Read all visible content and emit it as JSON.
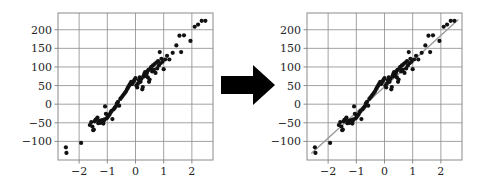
{
  "figure": {
    "title": "",
    "panel_count": 2,
    "arrow": {
      "icon": "right-arrow-icon",
      "direction": "right",
      "color": "#000000"
    }
  },
  "chart_data": [
    {
      "id": "left",
      "type": "scatter",
      "title": "",
      "subtitle": "",
      "xlabel": "",
      "ylabel": "",
      "xlim": [
        -2.75,
        2.75
      ],
      "ylim": [
        -150,
        245
      ],
      "xticks": [
        -2,
        -1,
        0,
        1,
        2
      ],
      "xticklabels": [
        "−2",
        "−1",
        "0",
        "1",
        "2"
      ],
      "yticks": [
        -100,
        -50,
        0,
        50,
        100,
        150,
        200
      ],
      "yticklabels": [
        "−100",
        "−50",
        "0",
        "50",
        "100",
        "150",
        "200"
      ],
      "grid": true,
      "legend": null,
      "annotations": [],
      "marker": {
        "shape": "circle",
        "color": "#111111",
        "size": 2.1
      },
      "fit_line": null,
      "x": [
        -2.47,
        -2.45,
        -1.93,
        -1.62,
        -1.57,
        -1.53,
        -1.5,
        -1.48,
        -1.45,
        -1.42,
        -1.38,
        -1.35,
        -1.32,
        -1.3,
        -1.28,
        -1.26,
        -1.24,
        -1.22,
        -1.2,
        -1.18,
        -1.16,
        -1.14,
        -1.12,
        -1.1,
        -1.08,
        -1.05,
        -1.02,
        -0.98,
        -0.95,
        -0.92,
        -0.88,
        -0.85,
        -0.82,
        -0.78,
        -0.74,
        -0.7,
        -0.66,
        -0.62,
        -0.58,
        -0.54,
        -0.5,
        -0.46,
        -0.42,
        -0.38,
        -0.34,
        -0.3,
        -0.27,
        -0.24,
        -0.21,
        -0.18,
        -0.15,
        -0.12,
        -0.09,
        -0.06,
        -0.03,
        0.0,
        0.03,
        0.06,
        0.09,
        0.12,
        0.15,
        0.18,
        0.21,
        0.24,
        0.26,
        0.28,
        0.3,
        0.32,
        0.34,
        0.36,
        0.38,
        0.4,
        0.42,
        0.44,
        0.46,
        0.48,
        0.5,
        0.53,
        0.56,
        0.59,
        0.62,
        0.65,
        0.68,
        0.71,
        0.74,
        0.77,
        0.8,
        0.83,
        0.86,
        0.89,
        0.92,
        0.96,
        1.0,
        1.05,
        1.12,
        1.2,
        1.32,
        1.45,
        1.56,
        1.62,
        1.72,
        1.95,
        2.1,
        2.22,
        2.35,
        2.48
      ],
      "y": [
        -116,
        -131,
        -104,
        -56,
        -48,
        -60,
        -70,
        -68,
        -46,
        -42,
        -40,
        -36,
        -51,
        -49,
        -47,
        -44,
        -50,
        -45,
        -48,
        -43,
        -46,
        -52,
        -44,
        -41,
        -6,
        -26,
        -38,
        -34,
        -30,
        -28,
        -22,
        -18,
        -40,
        -14,
        -10,
        -6,
        2,
        6,
        -4,
        14,
        18,
        22,
        26,
        30,
        34,
        40,
        44,
        48,
        52,
        56,
        60,
        54,
        58,
        62,
        66,
        70,
        50,
        45,
        56,
        64,
        72,
        60,
        68,
        40,
        46,
        74,
        78,
        82,
        86,
        76,
        80,
        84,
        88,
        72,
        92,
        60,
        66,
        96,
        100,
        88,
        104,
        92,
        108,
        84,
        112,
        96,
        116,
        104,
        140,
        110,
        122,
        114,
        94,
        120,
        130,
        120,
        138,
        158,
        184,
        140,
        185,
        170,
        208,
        214,
        224,
        224
      ]
    },
    {
      "id": "right",
      "type": "scatter",
      "title": "",
      "subtitle": "",
      "xlabel": "",
      "ylabel": "",
      "xlim": [
        -2.75,
        2.75
      ],
      "ylim": [
        -150,
        245
      ],
      "xticks": [
        -2,
        -1,
        0,
        1,
        2
      ],
      "xticklabels": [
        "−2",
        "−1",
        "0",
        "1",
        "2"
      ],
      "yticks": [
        -100,
        -50,
        0,
        50,
        100,
        150,
        200
      ],
      "yticklabels": [
        "−100",
        "−50",
        "0",
        "50",
        "100",
        "150",
        "200"
      ],
      "grid": true,
      "legend": null,
      "annotations": [],
      "marker": {
        "shape": "circle",
        "color": "#111111",
        "size": 2.1
      },
      "fit_line": {
        "type": "linear-regression",
        "slope": 69.0,
        "intercept": 47.0,
        "color": "#9a9a9a",
        "x_start": -2.6,
        "x_end": 2.62
      },
      "x": [
        -2.47,
        -2.45,
        -1.93,
        -1.62,
        -1.57,
        -1.53,
        -1.5,
        -1.48,
        -1.45,
        -1.42,
        -1.38,
        -1.35,
        -1.32,
        -1.3,
        -1.28,
        -1.26,
        -1.24,
        -1.22,
        -1.2,
        -1.18,
        -1.16,
        -1.14,
        -1.12,
        -1.1,
        -1.08,
        -1.05,
        -1.02,
        -0.98,
        -0.95,
        -0.92,
        -0.88,
        -0.85,
        -0.82,
        -0.78,
        -0.74,
        -0.7,
        -0.66,
        -0.62,
        -0.58,
        -0.54,
        -0.5,
        -0.46,
        -0.42,
        -0.38,
        -0.34,
        -0.3,
        -0.27,
        -0.24,
        -0.21,
        -0.18,
        -0.15,
        -0.12,
        -0.09,
        -0.06,
        -0.03,
        0.0,
        0.03,
        0.06,
        0.09,
        0.12,
        0.15,
        0.18,
        0.21,
        0.24,
        0.26,
        0.28,
        0.3,
        0.32,
        0.34,
        0.36,
        0.38,
        0.4,
        0.42,
        0.44,
        0.46,
        0.48,
        0.5,
        0.53,
        0.56,
        0.59,
        0.62,
        0.65,
        0.68,
        0.71,
        0.74,
        0.77,
        0.8,
        0.83,
        0.86,
        0.89,
        0.92,
        0.96,
        1.0,
        1.05,
        1.12,
        1.2,
        1.32,
        1.45,
        1.56,
        1.62,
        1.72,
        1.95,
        2.1,
        2.22,
        2.35,
        2.48
      ],
      "y": [
        -116,
        -131,
        -104,
        -56,
        -48,
        -60,
        -70,
        -68,
        -46,
        -42,
        -40,
        -36,
        -51,
        -49,
        -47,
        -44,
        -50,
        -45,
        -48,
        -43,
        -46,
        -52,
        -44,
        -41,
        -6,
        -26,
        -38,
        -34,
        -30,
        -28,
        -22,
        -18,
        -40,
        -14,
        -10,
        -6,
        2,
        6,
        -4,
        14,
        18,
        22,
        26,
        30,
        34,
        40,
        44,
        48,
        52,
        56,
        60,
        54,
        58,
        62,
        66,
        70,
        50,
        45,
        56,
        64,
        72,
        60,
        68,
        40,
        46,
        74,
        78,
        82,
        86,
        76,
        80,
        84,
        88,
        72,
        92,
        60,
        66,
        96,
        100,
        88,
        104,
        92,
        108,
        84,
        112,
        96,
        116,
        104,
        140,
        110,
        122,
        114,
        94,
        120,
        130,
        120,
        138,
        158,
        184,
        140,
        185,
        170,
        208,
        214,
        224,
        224
      ]
    }
  ]
}
